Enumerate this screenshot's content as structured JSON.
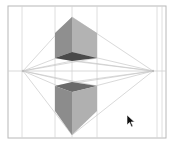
{
  "diagram": {
    "frame": {
      "x": 8,
      "y": 6,
      "width": 158,
      "height": 132,
      "stroke": "#b8b8b8"
    },
    "horizon_y": 71,
    "vanishing_points": [
      {
        "x": 23,
        "y": 71
      },
      {
        "x": 153,
        "y": 71
      }
    ],
    "guide_verticals": [
      22,
      55,
      72,
      97,
      157,
      162
    ],
    "colors": {
      "guide_line": "#d0d0d0",
      "perspective_line": "#c4c4c4",
      "face_left": "#8f8f8f",
      "face_right": "#b2b2b2",
      "face_bottom": "#4a4a4a",
      "face_top": "#6a6a6a",
      "background": "#ffffff"
    },
    "upper_cube": {
      "top": [
        72,
        17
      ],
      "left_top": [
        55,
        33
      ],
      "right_top": [
        97,
        33
      ],
      "left_bottom": [
        55,
        58
      ],
      "front_bottom": [
        72,
        52
      ],
      "right_bottom": [
        97,
        58
      ],
      "bottom_back": [
        72,
        61
      ]
    },
    "lower_cube": {
      "left_top": [
        55,
        86
      ],
      "right_top": [
        97,
        86
      ],
      "front_top": [
        72,
        92
      ],
      "back_top": [
        72,
        82
      ],
      "left_bottom": [
        55,
        111
      ],
      "right_bottom": [
        97,
        111
      ],
      "bottom": [
        72,
        135
      ]
    }
  },
  "cursor": {
    "x": 128,
    "y": 116,
    "type": "arrow"
  }
}
